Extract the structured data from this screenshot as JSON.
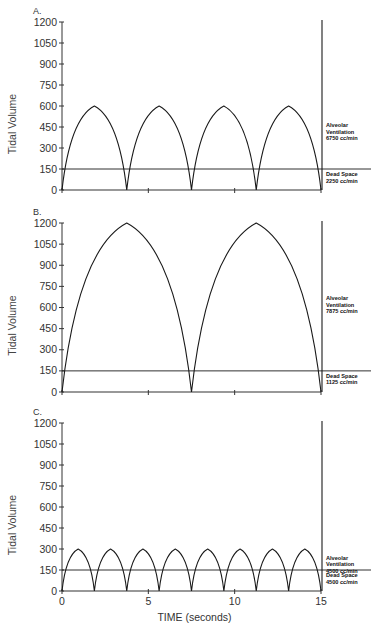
{
  "chart_data": [
    {
      "panel": "A.",
      "type": "line",
      "title": "",
      "xlabel": "",
      "ylabel": "Tidal Volume",
      "xlim": [
        0,
        15
      ],
      "ylim": [
        0,
        1200
      ],
      "yticks": [
        0,
        150,
        300,
        450,
        600,
        750,
        900,
        1050,
        1200
      ],
      "xticks": [
        0,
        5,
        10,
        15
      ],
      "xtick_labels_visible": false,
      "grid": false,
      "series": [
        {
          "name": "Tidal volume curve",
          "breaths": 4,
          "breath_duration_s": 3.75,
          "peak": 600,
          "x": [
            0,
            1.875,
            3.75,
            5.625,
            7.5,
            9.375,
            11.25,
            13.125,
            15
          ],
          "y": [
            0,
            600,
            0,
            600,
            0,
            600,
            0,
            600,
            0
          ]
        },
        {
          "name": "Dead space line",
          "x": [
            0,
            15
          ],
          "y": [
            150,
            150
          ]
        }
      ],
      "annotations": [
        {
          "text_lines": [
            "Alveolar",
            "Ventilation",
            "6750 cc/min"
          ],
          "y": 450
        },
        {
          "text_lines": [
            "Dead Space",
            "2250 cc/min"
          ],
          "y": 75
        }
      ]
    },
    {
      "panel": "B.",
      "type": "line",
      "title": "",
      "xlabel": "",
      "ylabel": "Tidal Volume",
      "xlim": [
        0,
        15
      ],
      "ylim": [
        0,
        1200
      ],
      "yticks": [
        0,
        150,
        300,
        450,
        600,
        750,
        900,
        1050,
        1200
      ],
      "xticks": [
        0,
        5,
        10,
        15
      ],
      "xtick_labels_visible": false,
      "grid": false,
      "series": [
        {
          "name": "Tidal volume curve",
          "breaths": 2,
          "breath_duration_s": 7.5,
          "peak": 1200,
          "x": [
            0,
            3.75,
            7.5,
            11.25,
            15
          ],
          "y": [
            0,
            1200,
            0,
            1200,
            0
          ]
        },
        {
          "name": "Dead space line",
          "x": [
            0,
            15
          ],
          "y": [
            150,
            150
          ]
        }
      ],
      "annotations": [
        {
          "text_lines": [
            "Alveolar",
            "Ventilation",
            "7875 cc/min"
          ],
          "y": 650
        },
        {
          "text_lines": [
            "Dead Space",
            "1125 cc/min"
          ],
          "y": 75
        }
      ]
    },
    {
      "panel": "C.",
      "type": "line",
      "title": "",
      "xlabel": "TIME (seconds)",
      "ylabel": "Tidal Volume",
      "xlim": [
        0,
        15
      ],
      "ylim": [
        0,
        1200
      ],
      "yticks": [
        0,
        150,
        300,
        450,
        600,
        750,
        900,
        1050,
        1200
      ],
      "xticks": [
        0,
        5,
        10,
        15
      ],
      "xtick_labels_visible": true,
      "grid": false,
      "series": [
        {
          "name": "Tidal volume curve",
          "breaths": 8,
          "breath_duration_s": 1.875,
          "peak": 300,
          "x": [
            0,
            0.9375,
            1.875,
            2.8125,
            3.75,
            4.6875,
            5.625,
            6.5625,
            7.5,
            8.4375,
            9.375,
            10.3125,
            11.25,
            12.1875,
            13.125,
            14.0625,
            15
          ],
          "y": [
            0,
            300,
            0,
            300,
            0,
            300,
            0,
            300,
            0,
            300,
            0,
            300,
            0,
            300,
            0,
            300,
            0
          ]
        },
        {
          "name": "Dead space line",
          "x": [
            0,
            15
          ],
          "y": [
            150,
            150
          ]
        }
      ],
      "annotations": [
        {
          "text_lines": [
            "Alveolar",
            "Ventilation",
            "4500 cc/min"
          ],
          "y": 225
        },
        {
          "text_lines": [
            "Dead Space",
            "4500 cc/min"
          ],
          "y": 75
        }
      ]
    }
  ],
  "layout": {
    "panels": [
      {
        "top": 22,
        "bottom": 190
      },
      {
        "top": 223,
        "bottom": 392
      },
      {
        "top": 423,
        "bottom": 591
      }
    ],
    "x_left": 62,
    "x_right": 321,
    "line_color": "#1a1a1a",
    "axis_color": "#333333"
  }
}
